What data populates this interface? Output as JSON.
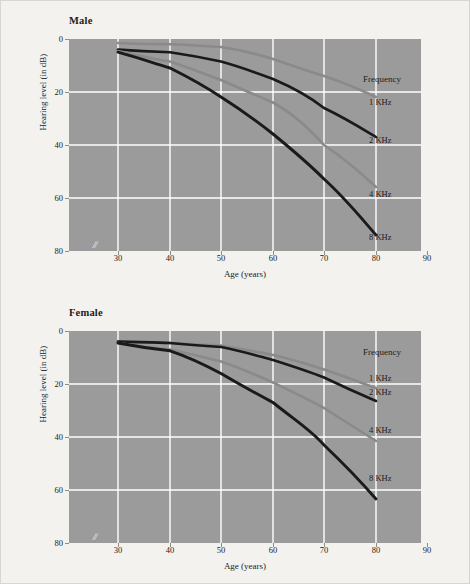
{
  "figure": {
    "background_color": "#f3f2ef",
    "plot_background_color": "#9b9b9b",
    "gridline_color": "#ffffff"
  },
  "panels": [
    {
      "id": "male",
      "title": "Male"
    },
    {
      "id": "female",
      "title": "Female"
    }
  ],
  "axes": {
    "xlabel": "Age (years)",
    "ylabel": "Hearing level (in dB)",
    "xticks": [
      "30",
      "40",
      "50",
      "60",
      "70",
      "80",
      "90"
    ],
    "yticks": [
      "0",
      "20",
      "40",
      "60",
      "80"
    ],
    "axis_break_symbol": "//"
  },
  "legend": {
    "title": "Frequency",
    "entries": [
      "1 KHz",
      "2 KHz",
      "4 KHz",
      "8 KHz"
    ]
  },
  "series_colors": {
    "1 KHz": "#8a8a8a",
    "2 KHz": "#1a1a1a",
    "4 KHz": "#8a8a8a",
    "8 KHz": "#1a1a1a"
  },
  "chart_data": [
    {
      "type": "line",
      "title": "Male",
      "xlabel": "Age (years)",
      "ylabel": "Hearing level (in dB)",
      "xlim": [
        25,
        92
      ],
      "ylim": [
        0,
        80
      ],
      "y_inverted": true,
      "grid": true,
      "legend_position": "right-inside",
      "legend_title": "Frequency",
      "x": [
        30,
        40,
        50,
        60,
        70,
        80
      ],
      "series": [
        {
          "name": "1 KHz",
          "color": "#8a8a8a",
          "values": [
            1.5,
            2.0,
            3.0,
            7.5,
            14.0,
            22.0
          ]
        },
        {
          "name": "2 KHz",
          "color": "#1a1a1a",
          "values": [
            4.0,
            5.0,
            8.5,
            15.0,
            26.0,
            37.0
          ]
        },
        {
          "name": "4 KHz",
          "color": "#8a8a8a",
          "values": [
            4.5,
            8.5,
            15.5,
            24.0,
            40.0,
            56.0
          ]
        },
        {
          "name": "8 KHz",
          "color": "#1a1a1a",
          "values": [
            5.0,
            11.0,
            22.0,
            36.0,
            53.0,
            74.0
          ]
        }
      ]
    },
    {
      "type": "line",
      "title": "Female",
      "xlabel": "Age (years)",
      "ylabel": "Hearing level (in dB)",
      "xlim": [
        25,
        92
      ],
      "ylim": [
        0,
        80
      ],
      "y_inverted": true,
      "grid": true,
      "legend_position": "right-inside",
      "legend_title": "Frequency",
      "x": [
        30,
        40,
        50,
        60,
        70,
        80
      ],
      "series": [
        {
          "name": "1 KHz",
          "color": "#8a8a8a",
          "values": [
            4.0,
            4.5,
            5.5,
            9.0,
            14.5,
            21.5
          ]
        },
        {
          "name": "2 KHz",
          "color": "#1a1a1a",
          "values": [
            4.0,
            4.5,
            6.0,
            11.0,
            17.5,
            26.5
          ]
        },
        {
          "name": "4 KHz",
          "color": "#8a8a8a",
          "values": [
            4.5,
            7.0,
            11.5,
            19.5,
            29.0,
            41.5
          ]
        },
        {
          "name": "8 KHz",
          "color": "#1a1a1a",
          "values": [
            4.5,
            7.5,
            16.0,
            27.0,
            43.0,
            63.5
          ]
        }
      ]
    }
  ]
}
